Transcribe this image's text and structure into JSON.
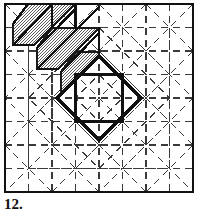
{
  "figure": {
    "caption": "12.",
    "kind": "quilt-block-diagram",
    "background_color": "#ffffff",
    "ink_color": "#1a1a1a",
    "shade_color": "#8c8c8c",
    "frame": {
      "x": 5,
      "y": 4,
      "width": 188,
      "height": 188,
      "stroke_width": 2.2
    },
    "grid": {
      "divisions": 8,
      "cell": 23.5,
      "origin_x": 5,
      "origin_y": 4,
      "dash_pattern": "7 5",
      "stroke_width": 1.1,
      "visible": true
    },
    "center": {
      "x": 99,
      "y": 98
    },
    "bold_diamond": {
      "label": "bold diamond",
      "points": "99,56 141,98 99,140 57,98",
      "stroke_width": 3.0
    },
    "bold_square": {
      "label": "bold inner square",
      "x": 75,
      "y": 74,
      "width": 48,
      "height": 48,
      "stroke_width": 2.6
    },
    "shaded_bands": {
      "label": "stippled diagonal bands",
      "count": 3,
      "angle_deg": 45,
      "fill": "stipple",
      "bands": [
        {
          "id": "band-1",
          "points": "28,4 75,4 34,45 13,45 13,24"
        },
        {
          "id": "band-2",
          "points": "52,28 99,28 58,69 37,69 37,48"
        },
        {
          "id": "band-3",
          "points": "76,52 99,52 99,56 81,74 61,93 61,72"
        }
      ]
    },
    "bold_diagonals": {
      "label": "bold staircase edges",
      "paths": [
        "M13,24 L28,4",
        "M13,45 L52,4",
        "M37,48 L75,4 L75,28",
        "M37,69 L99,4",
        "M61,72 L99,32",
        "M61,93 L99,52",
        "M28,4 L75,45",
        "M13,45 L34,45",
        "M37,69 L58,69"
      ],
      "stroke_width": 2.4
    },
    "caption_font_size_px": 15
  }
}
